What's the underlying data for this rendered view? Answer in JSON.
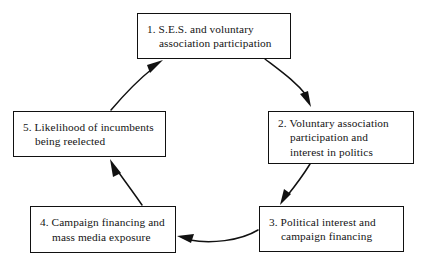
{
  "figure": {
    "type": "cyclical-flow-diagram",
    "direction": "clockwise",
    "background_color": "#ffffff",
    "line_color": "#111111",
    "text_color": "#141414"
  },
  "nodes": [
    {
      "id": "node-1",
      "number": "1.",
      "text": "1.  S.E.S. and voluntary\nassociation participation"
    },
    {
      "id": "node-2",
      "number": "2.",
      "text": "2.  Voluntary association\nparticipation and\ninterest in politics"
    },
    {
      "id": "node-3",
      "number": "3.",
      "text": "3.  Political interest and\ncampaign financing"
    },
    {
      "id": "node-4",
      "number": "4.",
      "text": "4.  Campaign financing and\nmass media exposure"
    },
    {
      "id": "node-5",
      "number": "5.",
      "text": "5.  Likelihood of incumbents\nbeing reelected"
    }
  ],
  "arrows": [
    {
      "id": "arrow-1-to-2",
      "from": "node-1",
      "to": "node-2",
      "style": "curved",
      "head": "solid-triangle"
    },
    {
      "id": "arrow-2-to-3",
      "from": "node-2",
      "to": "node-3",
      "style": "curved",
      "head": "solid-triangle"
    },
    {
      "id": "arrow-3-to-4",
      "from": "node-3",
      "to": "node-4",
      "style": "curved",
      "head": "solid-triangle"
    },
    {
      "id": "arrow-4-to-5",
      "from": "node-4",
      "to": "node-5",
      "style": "curved",
      "head": "solid-triangle"
    },
    {
      "id": "arrow-5-to-1",
      "from": "node-5",
      "to": "node-1",
      "style": "curved",
      "head": "solid-triangle"
    }
  ]
}
